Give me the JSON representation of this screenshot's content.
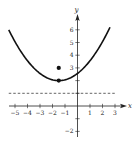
{
  "chart_data": {
    "type": "line",
    "title": "",
    "xlabel": "x",
    "ylabel": "y",
    "xlim": [
      -5.5,
      3.6
    ],
    "ylim": [
      -2.5,
      7
    ],
    "grid": false,
    "x_ticks": [
      -5,
      -4,
      -3,
      -2,
      -1,
      1,
      2,
      3
    ],
    "x_tick_labels": [
      "−5",
      "−4",
      "−3",
      "−2",
      "−1",
      "1",
      "2",
      "3"
    ],
    "y_ticks": [
      -2,
      -1,
      1,
      2,
      3,
      4,
      5,
      6
    ],
    "y_tick_labels_shown": [
      {
        "value": 6,
        "label": "6"
      },
      {
        "value": 5,
        "label": "5"
      },
      {
        "value": 4,
        "label": "4"
      },
      {
        "value": 3,
        "label": "3"
      },
      {
        "value": -2,
        "label": "−2"
      }
    ],
    "series": [
      {
        "name": "parabola",
        "kind": "curve",
        "equation": "y = 0.25(x + 1.5)^2 + 2",
        "vertex": [
          -1.5,
          2
        ],
        "a": 0.25,
        "x_domain": [
          -5.5,
          2.6
        ],
        "style": "solid",
        "color": "#111111"
      },
      {
        "name": "horizontal-line",
        "kind": "hline",
        "y": 1,
        "x_domain": [
          -5.5,
          3.1
        ],
        "style": "dashed",
        "color": "#222222"
      },
      {
        "name": "points",
        "kind": "scatter",
        "points": [
          [
            -1.5,
            2
          ],
          [
            -1.5,
            3
          ]
        ],
        "style": "filled",
        "color": "#111111"
      }
    ]
  }
}
